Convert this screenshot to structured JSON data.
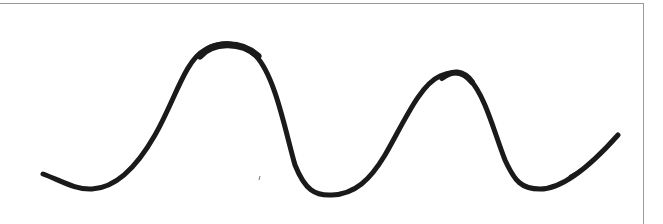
{
  "figure": {
    "stroke_color": "#1a1a1a",
    "border_color": "#9a9a9a",
    "background": "#ffffff",
    "curve_points": [
      [
        43,
        174
      ],
      [
        90,
        189
      ],
      [
        130,
        170
      ],
      [
        170,
        110
      ],
      [
        200,
        55
      ],
      [
        228,
        45
      ],
      [
        260,
        60
      ],
      [
        290,
        150
      ],
      [
        330,
        195
      ],
      [
        370,
        175
      ],
      [
        410,
        110
      ],
      [
        440,
        78
      ],
      [
        457,
        73
      ],
      [
        480,
        95
      ],
      [
        505,
        160
      ],
      [
        537,
        189
      ],
      [
        580,
        170
      ],
      [
        618,
        135
      ]
    ],
    "peaks": [
      [
        228,
        45
      ],
      [
        457,
        73
      ]
    ],
    "troughs": [
      [
        90,
        189
      ],
      [
        330,
        195
      ],
      [
        537,
        189
      ]
    ]
  }
}
